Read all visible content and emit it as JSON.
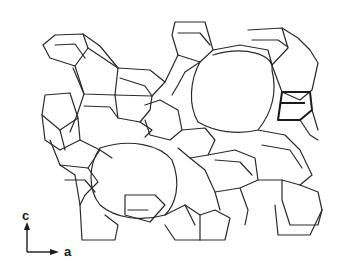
{
  "diagram": {
    "type": "crystal-framework-projection",
    "axes": {
      "vertical_label": "c",
      "horizontal_label": "a"
    },
    "colors": {
      "line": "#2a2a2a",
      "background": "#ffffff"
    }
  }
}
